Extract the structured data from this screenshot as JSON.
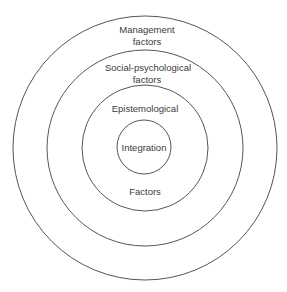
{
  "diagram": {
    "type": "concentric-circles",
    "center": [
      145,
      148
    ],
    "rings": [
      {
        "name": "outer",
        "radius": 132,
        "label_lines": [
          "Management",
          "factors"
        ]
      },
      {
        "name": "second",
        "radius": 98,
        "label_lines": [
          "Social-psychological",
          "factors"
        ]
      },
      {
        "name": "third",
        "radius": 63,
        "label_top": "Epistemological",
        "label_bottom": "Factors"
      },
      {
        "name": "core",
        "radius": 27,
        "label": "Integration"
      }
    ],
    "stroke_color": "#555555",
    "text_color": "#3a3a3a"
  }
}
